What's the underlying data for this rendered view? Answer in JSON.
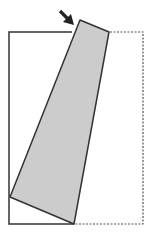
{
  "diagram": {
    "description": "Rectangle (page) with a rotated grey quadrilateral tilted from the top edge, dashed outline showing original position, and an arrow indicating push direction",
    "colors": {
      "background": "#ffffff",
      "outline": "#333333",
      "fill": "#cccccc",
      "dashed": "#555555",
      "arrow": "#222222"
    },
    "shapes": {
      "frame_solid": {
        "points": "72,32 9,32 9,224 74,224"
      },
      "frame_dashed": {
        "points": "110,32 143,32 143,224 74,224"
      },
      "rotated_panel": {
        "points": "80,20 109,32 74,224 10,197"
      },
      "arrow": {
        "from": [
          60,
          11
        ],
        "to": [
          73,
          24
        ]
      }
    }
  }
}
